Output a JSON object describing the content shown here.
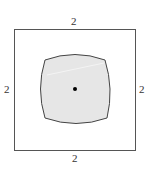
{
  "diagram": {
    "outer_square": {
      "x": 14,
      "y": 29,
      "width": 121,
      "height": 121,
      "stroke": "#555555",
      "side_labels": {
        "top": "2",
        "bottom": "2",
        "left": "2",
        "right": "2"
      }
    },
    "shaded_region": {
      "fill": "#e6e6e6",
      "stroke": "#444444",
      "corners": {
        "top_left": [
          45,
          60
        ],
        "top_right": [
          105,
          60
        ],
        "bottom_right": [
          107,
          118
        ],
        "bottom_left": [
          45,
          118
        ]
      }
    },
    "center_point": {
      "cx": 75,
      "cy": 89,
      "r": 2,
      "color": "#000000"
    }
  }
}
